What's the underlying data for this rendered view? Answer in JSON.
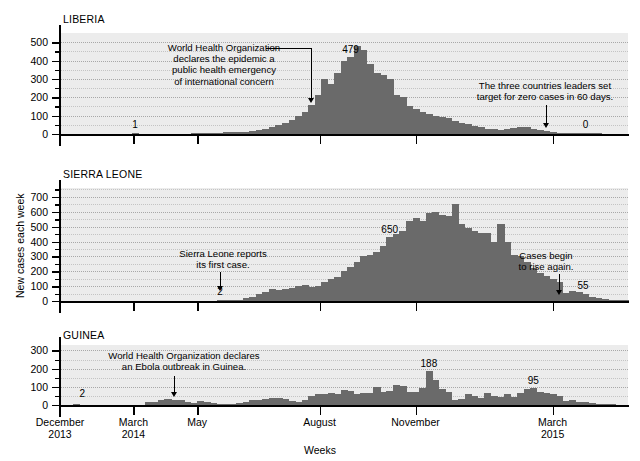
{
  "figure": {
    "ylabel": "New cases each week",
    "xlabel": "Weeks",
    "bar_color": "#6a6a6a",
    "plot_bg": "#ececec"
  },
  "x_axis": {
    "tick_labels": [
      {
        "line1": "December",
        "line2": "2013",
        "pos": 0.0
      },
      {
        "line1": "March",
        "line2": "2014",
        "pos": 0.1293
      },
      {
        "line1": "May",
        "line2": "",
        "pos": 0.2414
      },
      {
        "line1": "August",
        "line2": "",
        "pos": 0.4569
      },
      {
        "line1": "November",
        "line2": "",
        "pos": 0.6259
      },
      {
        "line1": "March",
        "line2": "2015",
        "pos": 0.8672
      }
    ]
  },
  "chart_data": [
    {
      "type": "bar",
      "title": "LIBERIA",
      "xlabel": "Weeks",
      "ylabel": "New cases each week",
      "ylim": [
        0,
        550
      ],
      "yticks": [
        0,
        100,
        200,
        300,
        400,
        500
      ],
      "yminor_step": 50,
      "grid": true,
      "peak_label": {
        "text": "479",
        "index": 44
      },
      "annotations": [
        {
          "text": "World Health Organization\ndeclares the epidemic a\npublic health emergency\nof international concern",
          "target_index": 38,
          "kind": "elbow-arrow"
        },
        {
          "text": "The three countries leaders set\ntarget for zero cases in 60 days.",
          "target_index": 74,
          "kind": "down-arrow"
        }
      ],
      "point_labels": [
        {
          "text": "1",
          "index": 11
        },
        {
          "text": "0",
          "index": 80
        }
      ],
      "values": [
        0,
        0,
        0,
        0,
        0,
        0,
        0,
        0,
        0,
        0,
        0,
        1,
        0,
        0,
        0,
        0,
        0,
        0,
        0,
        0,
        2,
        3,
        4,
        5,
        8,
        10,
        12,
        10,
        9,
        14,
        22,
        30,
        38,
        50,
        62,
        78,
        96,
        120,
        160,
        210,
        300,
        270,
        330,
        400,
        420,
        479,
        455,
        380,
        330,
        320,
        300,
        210,
        200,
        150,
        135,
        120,
        110,
        100,
        95,
        85,
        70,
        58,
        52,
        45,
        38,
        30,
        26,
        22,
        28,
        34,
        40,
        38,
        30,
        22,
        15,
        10,
        8,
        6,
        5,
        4,
        3,
        2,
        1,
        0,
        0,
        0,
        0
      ]
    },
    {
      "type": "bar",
      "title": "SIERRA LEONE",
      "xlabel": "Weeks",
      "ylabel": "New cases each week",
      "ylim": [
        0,
        760
      ],
      "yticks": [
        0,
        100,
        200,
        300,
        400,
        500,
        600,
        700
      ],
      "yminor_step": 50,
      "grid": true,
      "peak_label": {
        "text": "650",
        "index": 50
      },
      "annotations": [
        {
          "text": "Sierra Leone reports\nits first case.",
          "target_index": 24,
          "kind": "down-arrow"
        },
        {
          "text": "Cases begin\nto rise again.",
          "target_index": 76,
          "kind": "down-arrow"
        }
      ],
      "point_labels": [
        {
          "text": "2",
          "index": 24
        },
        {
          "text": "55",
          "index": 77
        }
      ],
      "values": [
        0,
        0,
        0,
        0,
        0,
        0,
        0,
        0,
        0,
        0,
        0,
        0,
        0,
        0,
        0,
        0,
        0,
        0,
        0,
        0,
        0,
        0,
        0,
        0,
        2,
        4,
        6,
        10,
        20,
        30,
        45,
        60,
        80,
        75,
        78,
        90,
        100,
        110,
        95,
        100,
        130,
        150,
        160,
        200,
        230,
        260,
        300,
        310,
        330,
        370,
        430,
        450,
        470,
        540,
        560,
        540,
        590,
        600,
        580,
        570,
        650,
        520,
        490,
        470,
        460,
        455,
        400,
        520,
        400,
        310,
        300,
        260,
        220,
        190,
        170,
        150,
        130,
        55,
        70,
        60,
        45,
        30,
        20,
        15,
        10,
        6,
        4
      ]
    },
    {
      "type": "bar",
      "title": "GUINEA",
      "xlabel": "Weeks",
      "ylabel": "New cases each week",
      "ylim": [
        0,
        330
      ],
      "yticks": [
        0,
        100,
        200,
        300
      ],
      "yminor_step": 50,
      "grid": true,
      "peak_label": {
        "text": "188",
        "index": 56
      },
      "annotations": [
        {
          "text": "World Health Organization declares\nan Ebola outbreak in Guinea.",
          "target_index": 17,
          "kind": "down-arrow"
        }
      ],
      "point_labels": [
        {
          "text": "2",
          "index": 2
        },
        {
          "text": "95",
          "index": 72
        }
      ],
      "values": [
        0,
        0,
        2,
        0,
        0,
        0,
        0,
        0,
        0,
        0,
        0,
        0,
        0,
        14,
        16,
        30,
        32,
        28,
        26,
        14,
        12,
        20,
        18,
        10,
        8,
        6,
        8,
        12,
        18,
        30,
        28,
        34,
        40,
        36,
        32,
        22,
        18,
        26,
        52,
        58,
        60,
        64,
        62,
        80,
        78,
        60,
        64,
        66,
        100,
        72,
        75,
        110,
        105,
        70,
        72,
        94,
        188,
        140,
        88,
        70,
        30,
        34,
        60,
        52,
        38,
        66,
        50,
        44,
        60,
        46,
        64,
        88,
        95,
        70,
        64,
        60,
        50,
        20,
        30,
        18,
        16,
        10,
        6,
        4,
        2,
        0,
        0
      ]
    }
  ]
}
